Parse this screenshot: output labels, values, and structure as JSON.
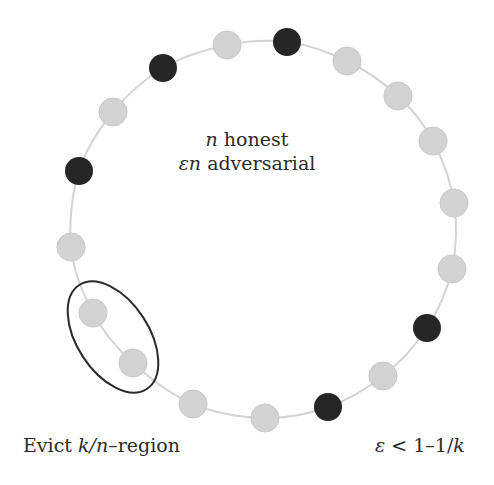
{
  "diagram": {
    "ring": {
      "stroke": "#d4d4d4",
      "node_radius": 14
    },
    "colors": {
      "honest": "#d3d3d3",
      "honest_stroke": "#c8c8c8",
      "adversarial": "#262626",
      "ellipse": "#2a2a2a"
    },
    "nodes": [
      {
        "x": 227,
        "y": 45,
        "type": "honest"
      },
      {
        "x": 287,
        "y": 42,
        "type": "adversarial"
      },
      {
        "x": 347,
        "y": 61,
        "type": "honest"
      },
      {
        "x": 398,
        "y": 96,
        "type": "honest"
      },
      {
        "x": 433,
        "y": 141,
        "type": "honest"
      },
      {
        "x": 454,
        "y": 203,
        "type": "honest"
      },
      {
        "x": 452,
        "y": 269,
        "type": "honest"
      },
      {
        "x": 427,
        "y": 328,
        "type": "adversarial"
      },
      {
        "x": 383,
        "y": 376,
        "type": "honest"
      },
      {
        "x": 328,
        "y": 407,
        "type": "adversarial"
      },
      {
        "x": 265,
        "y": 418,
        "type": "honest"
      },
      {
        "x": 193,
        "y": 404,
        "type": "honest"
      },
      {
        "x": 133,
        "y": 363,
        "type": "honest"
      },
      {
        "x": 93,
        "y": 313,
        "type": "honest"
      },
      {
        "x": 71,
        "y": 247,
        "type": "honest"
      },
      {
        "x": 79,
        "y": 171,
        "type": "adversarial"
      },
      {
        "x": 113,
        "y": 112,
        "type": "honest"
      },
      {
        "x": 163,
        "y": 68,
        "type": "adversarial"
      }
    ],
    "evict_region": {
      "cx": 113,
      "cy": 337,
      "rx": 36,
      "ry": 62,
      "rotate": -33
    },
    "center_label": {
      "line1_var": "n",
      "line1_text": " honest",
      "line2_var": "εn",
      "line2_text": " adversarial"
    },
    "bottom_left_label": {
      "prefix": "Evict ",
      "var": "k/n",
      "suffix": "–region"
    },
    "bottom_right_label": {
      "var1": "ε",
      "middle": " < 1–1/",
      "var2": "k"
    }
  }
}
